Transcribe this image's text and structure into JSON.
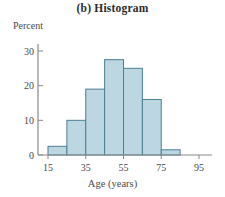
{
  "figure": {
    "title": "(b)  Histogram",
    "ylabel": "Percent",
    "xlabel": "Age (years)"
  },
  "colors": {
    "bar_fill": "#bdd7e2",
    "bar_edge": "#4a7f93",
    "axis": "#8a8a8a",
    "text": "#4a4a4a"
  },
  "axes": {
    "y_ticks": [
      "0",
      "10",
      "20",
      "30"
    ],
    "x_ticks": [
      "15",
      "35",
      "55",
      "75",
      "95"
    ]
  },
  "chart_data": {
    "type": "bar",
    "title": "(b)  Histogram",
    "xlabel": "Age (years)",
    "ylabel": "Percent",
    "xlim": [
      5,
      100
    ],
    "ylim": [
      0,
      32
    ],
    "grid": false,
    "legend": null,
    "bin_width": 10,
    "bin_edges": [
      15,
      25,
      35,
      45,
      55,
      65,
      75,
      85
    ],
    "categories": [
      "15-25",
      "25-35",
      "35-45",
      "45-55",
      "55-65",
      "65-75",
      "75-85"
    ],
    "values": [
      2.5,
      10,
      19,
      27.5,
      25,
      16,
      1.5
    ],
    "x_tick_values": [
      15,
      35,
      55,
      75,
      95
    ],
    "y_tick_values": [
      0,
      10,
      20,
      30
    ]
  }
}
